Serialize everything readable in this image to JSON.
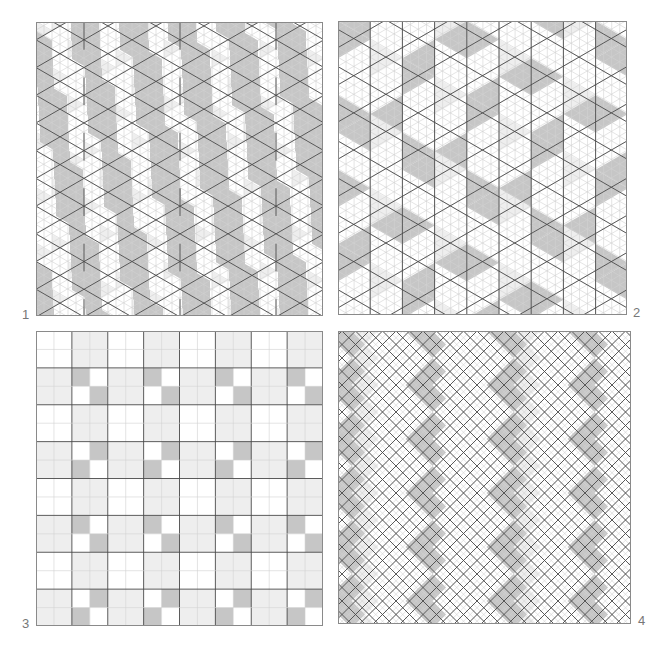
{
  "figure": {
    "colors": {
      "background": "#ffffff",
      "dark_fill": "#c6c6c6",
      "light_fill": "#eeeeee",
      "bold_line": "#4a4a4a",
      "thin_line": "#d2d2d2",
      "frame": "#8a8a8a",
      "label": "#777777"
    },
    "panels": [
      {
        "id": "1",
        "label": "1",
        "type": "triangular-grid-vertical-parallelograms",
        "x": 36,
        "y": 22,
        "w": 287,
        "h": 294,
        "label_pos": {
          "x": 22,
          "y": 308
        },
        "cell_w": 16
      },
      {
        "id": "2",
        "label": "2",
        "type": "triangular-grid-diagonal-bands",
        "x": 338,
        "y": 21,
        "w": 289,
        "h": 294,
        "label_pos": {
          "x": 633,
          "y": 306
        },
        "cell_w": 16.1
      },
      {
        "id": "3",
        "label": "3",
        "type": "square-grid-checker-blocks",
        "x": 36,
        "y": 331,
        "w": 287,
        "h": 295,
        "label_pos": {
          "x": 22,
          "y": 617
        },
        "cols": 16,
        "rows": 16
      },
      {
        "id": "4",
        "label": "4",
        "type": "diagonal-diamond-grid",
        "x": 338,
        "y": 331,
        "w": 293,
        "h": 293,
        "label_pos": {
          "x": 638,
          "y": 614
        },
        "diamond_w": 27
      }
    ]
  }
}
